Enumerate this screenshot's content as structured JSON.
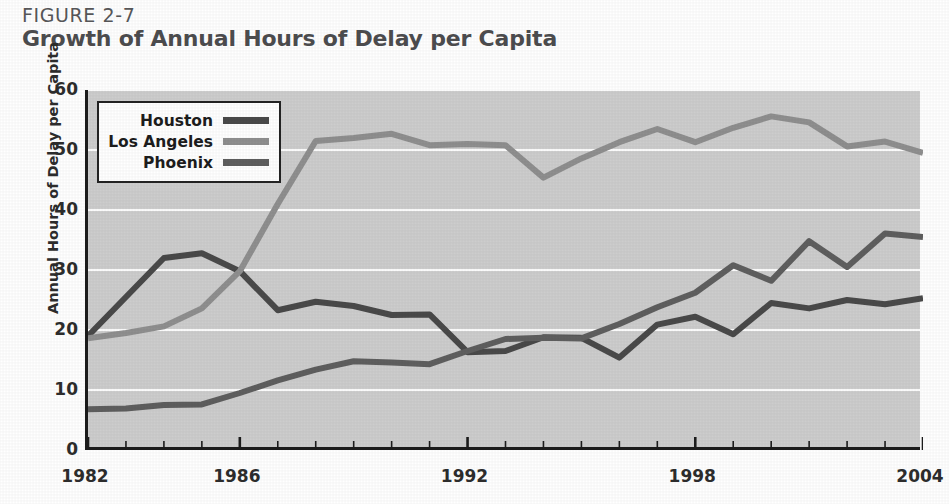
{
  "figure": {
    "number": "FIGURE 2-7",
    "title": "Growth of Annual Hours of Delay per Capita"
  },
  "chart_data": {
    "type": "line",
    "title": "Growth of Annual Hours of Delay per Capita",
    "subtitle": "FIGURE 2-7",
    "xlabel": "",
    "ylabel": "Annual Hours of Delay per Capita",
    "xlim": [
      1982,
      2004
    ],
    "ylim": [
      0,
      60
    ],
    "ytick_labels": [
      "0",
      "10",
      "20",
      "30",
      "40",
      "50",
      "60"
    ],
    "yticks": [
      0,
      10,
      20,
      30,
      40,
      50,
      60
    ],
    "xtick_labels": [
      "1982",
      "1986",
      "1992",
      "1998",
      "2004"
    ],
    "xticks": [
      1982,
      1986,
      1992,
      1998,
      2004
    ],
    "x": [
      1982,
      1983,
      1984,
      1985,
      1986,
      1987,
      1988,
      1989,
      1990,
      1991,
      1992,
      1993,
      1994,
      1995,
      1996,
      1997,
      1998,
      1999,
      2000,
      2001,
      2002,
      2003,
      2004
    ],
    "grid": "horizontal",
    "legend_position": "upper-left-inside",
    "plot_background": "#cdcdcd",
    "gridline_color": "#ffffff",
    "series": [
      {
        "name": "Houston",
        "color": "#4a4a4a",
        "values": [
          19.0,
          25.5,
          32.0,
          32.8,
          29.8,
          23.3,
          24.7,
          24.0,
          22.5,
          22.6,
          16.3,
          16.5,
          18.8,
          18.7,
          15.4,
          20.9,
          22.2,
          19.3,
          24.5,
          23.6,
          25.0,
          24.3,
          25.3
        ]
      },
      {
        "name": "Los Angeles",
        "color": "#8f8f8f",
        "values": [
          18.6,
          19.5,
          20.6,
          23.6,
          29.8,
          41.0,
          51.5,
          52.0,
          52.7,
          50.8,
          51.0,
          50.8,
          45.4,
          48.6,
          51.3,
          53.5,
          51.3,
          53.7,
          55.6,
          54.6,
          50.6,
          51.4,
          49.5
        ]
      },
      {
        "name": "Phoenix",
        "color": "#5f5f5f",
        "values": [
          6.8,
          6.9,
          7.5,
          7.6,
          9.5,
          11.6,
          13.4,
          14.8,
          14.6,
          14.3,
          16.5,
          18.5,
          18.7,
          18.6,
          21.0,
          23.8,
          26.2,
          30.8,
          28.2,
          34.8,
          30.5,
          36.1,
          35.5
        ]
      }
    ]
  },
  "axes": {
    "y_title": "Annual Hours of Delay per Capita"
  },
  "legend": {
    "items": [
      {
        "label": "Houston",
        "color": "#4a4a4a"
      },
      {
        "label": "Los Angeles",
        "color": "#8f8f8f"
      },
      {
        "label": "Phoenix",
        "color": "#5f5f5f"
      }
    ]
  }
}
